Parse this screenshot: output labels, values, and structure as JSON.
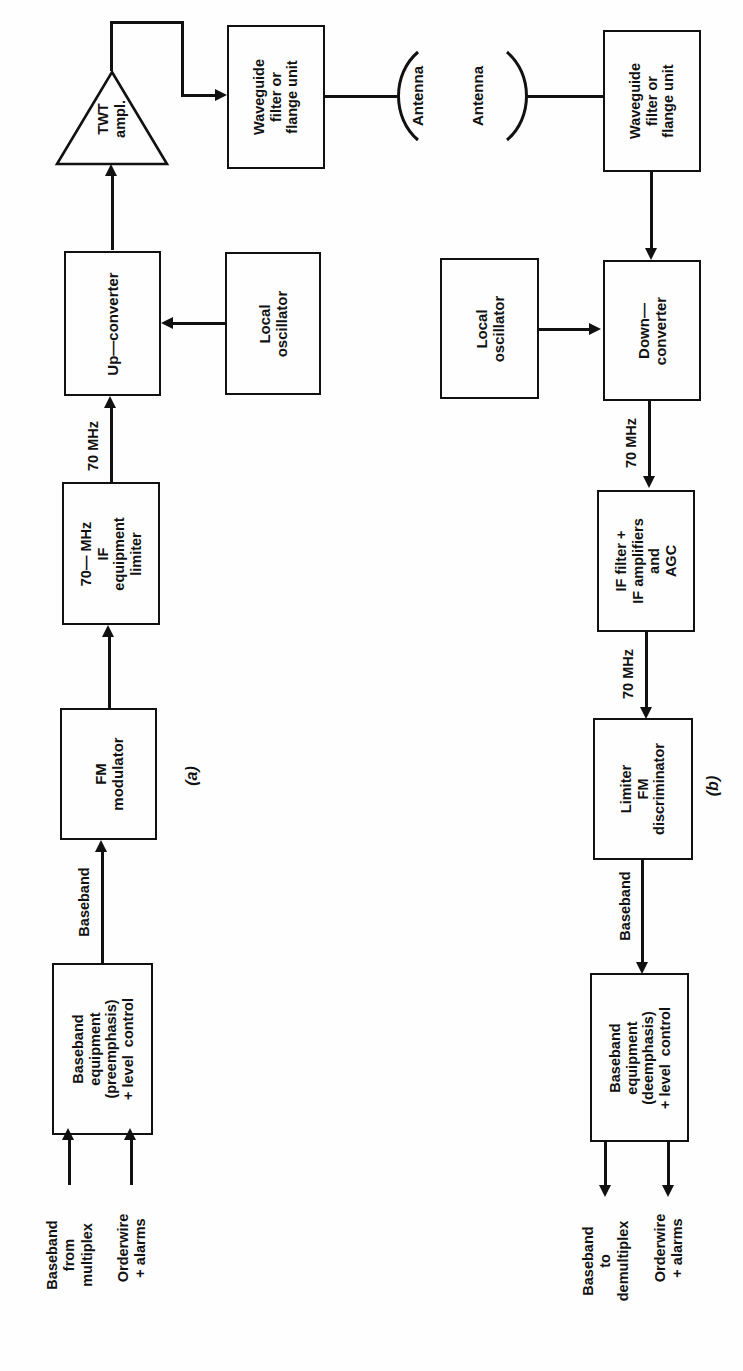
{
  "figure": {
    "type": "block-diagram",
    "orientation": "rotated-90-ccw"
  },
  "captions": {
    "a": "(a)",
    "b": "(b)"
  },
  "transmit": {
    "blocks": {
      "baseband_equipment": "Baseband\nequipment\n(preemphasis)\n+ level  control",
      "fm_modulator": "FM\nmodulator",
      "if_equipment": "70— MHz\nIF\nequipment\nlimiter",
      "up_converter": "Up—converter",
      "local_oscillator": "Local\noscillator",
      "twt_amplifier": "TWT\nampl.",
      "waveguide_filter": "Waveguide\nfilter or\nflange unit",
      "antenna": "Antenna"
    },
    "inputs": {
      "baseband_from_multiplex": "Baseband\nfrom\nmultiplex",
      "orderwire_alarms": "Orderwire\n+ alarms"
    },
    "flows": {
      "baseband": "Baseband",
      "if_70mhz": "70 MHz"
    }
  },
  "receive": {
    "blocks": {
      "antenna": "Antenna",
      "waveguide_filter": "Waveguide\nfilter or\nflange unit",
      "down_converter": "Down—\nconverter",
      "local_oscillator": "Local\noscillator",
      "if_filter_amplifiers": "IF filter +\nIF amplifiers\nand\nAGC",
      "limiter_discriminator": "Limiter\nFM\ndiscriminator",
      "baseband_equipment": "Baseband\nequipment\n(deemphasis)\n+ level  control"
    },
    "outputs": {
      "baseband_to_demultiplex": "Baseband\nto\ndemultiplex",
      "orderwire_alarms": "Orderwire\n+ alarms"
    },
    "flows": {
      "if_70mhz_in": "70 MHz",
      "if_70mhz_out": "70 MHz",
      "baseband": "Baseband"
    }
  },
  "colors": {
    "ink": "#111111",
    "paper": "#fefefe"
  }
}
